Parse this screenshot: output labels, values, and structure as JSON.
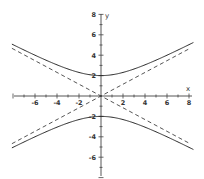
{
  "chart_data": {
    "type": "line",
    "title": "",
    "xlabel": "x",
    "ylabel": "y",
    "xlim": [
      -8,
      8
    ],
    "ylim": [
      -8,
      8
    ],
    "grid": false,
    "legend": null,
    "x_ticks": [
      -6,
      -4,
      -2,
      2,
      4,
      6,
      8
    ],
    "x_tick_labels": [
      "-6",
      "-4",
      "-2",
      "2",
      "4",
      "6",
      "8"
    ],
    "y_ticks": [
      8,
      6,
      4,
      2,
      -2,
      -4,
      -6
    ],
    "y_tick_labels": [
      "8",
      "6",
      "4",
      "2",
      "-2",
      "-4",
      "-6"
    ],
    "series": [
      {
        "name": "hyperbola upper branch",
        "style": "solid",
        "equation": "y^2/4 - x^2/12 = 1",
        "x": [
          -8,
          -6,
          -4,
          -2,
          0,
          2,
          4,
          6,
          8
        ],
        "values": [
          5.03,
          4.0,
          3.06,
          2.31,
          2.0,
          2.31,
          3.06,
          4.0,
          5.03
        ]
      },
      {
        "name": "hyperbola lower branch",
        "style": "solid",
        "equation": "y^2/4 - x^2/12 = 1",
        "x": [
          -8,
          -6,
          -4,
          -2,
          0,
          2,
          4,
          6,
          8
        ],
        "values": [
          -5.03,
          -4.0,
          -3.06,
          -2.31,
          -2.0,
          -2.31,
          -3.06,
          -4.0,
          -5.03
        ]
      },
      {
        "name": "asymptote y = x/sqrt(3)",
        "style": "dashed",
        "x": [
          -8,
          0,
          8
        ],
        "values": [
          -4.62,
          0,
          4.62
        ]
      },
      {
        "name": "asymptote y = -x/sqrt(3)",
        "style": "dashed",
        "x": [
          -8,
          0,
          8
        ],
        "values": [
          4.62,
          0,
          -4.62
        ]
      }
    ],
    "annotations": [],
    "colors": {
      "curve": "#2a2a2a",
      "axis": "#444444",
      "text": "#333333",
      "background": "#ffffff"
    }
  }
}
